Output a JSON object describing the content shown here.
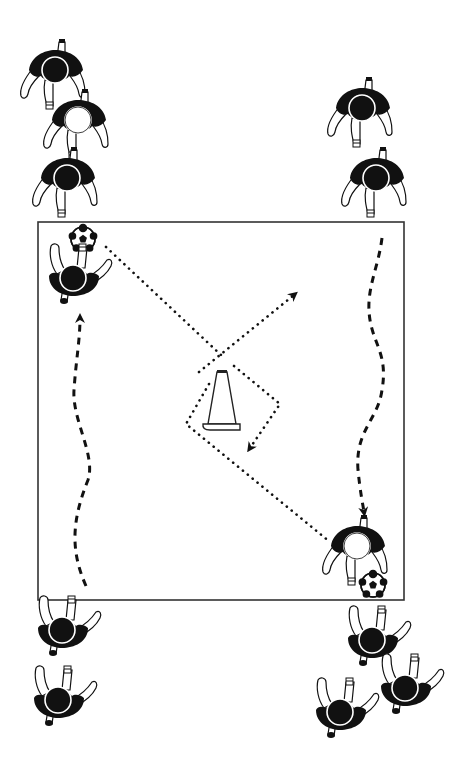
{
  "diagram": {
    "type": "soccer-drill",
    "description": "Dribble and pass around cone drill",
    "colors": {
      "background": "#ffffff",
      "ink": "#111111",
      "field_line": "#333333",
      "shirt": "#111111",
      "skin": "#ffffff"
    },
    "field": {
      "x": 38,
      "y": 222,
      "width": 366,
      "height": 378
    },
    "cone": {
      "x": 222,
      "y": 372,
      "label": "cone"
    },
    "balls": [
      {
        "id": "ball-left",
        "x": 83,
        "y": 239,
        "r": 12
      },
      {
        "id": "ball-right",
        "x": 373,
        "y": 585,
        "r": 12
      }
    ],
    "players": [
      {
        "id": "queue-top-left-1",
        "x": 55,
        "y": 72,
        "facing": "up",
        "head": "dark"
      },
      {
        "id": "queue-top-left-2",
        "x": 78,
        "y": 122,
        "facing": "up",
        "head": "light"
      },
      {
        "id": "queue-top-left-3",
        "x": 67,
        "y": 180,
        "facing": "up",
        "head": "dark"
      },
      {
        "id": "queue-top-right-1",
        "x": 362,
        "y": 110,
        "facing": "up",
        "head": "dark"
      },
      {
        "id": "queue-top-right-2",
        "x": 376,
        "y": 180,
        "facing": "up",
        "head": "dark"
      },
      {
        "id": "active-left",
        "x": 73,
        "y": 278,
        "facing": "down-arms",
        "head": "dark"
      },
      {
        "id": "active-right",
        "x": 357,
        "y": 548,
        "facing": "up",
        "head": "light"
      },
      {
        "id": "queue-bottom-left-1",
        "x": 62,
        "y": 630,
        "facing": "down-arms",
        "head": "dark"
      },
      {
        "id": "queue-bottom-left-2",
        "x": 58,
        "y": 700,
        "facing": "down-arms",
        "head": "dark"
      },
      {
        "id": "queue-bottom-right-1",
        "x": 372,
        "y": 640,
        "facing": "down-arms",
        "head": "dark"
      },
      {
        "id": "queue-bottom-right-2",
        "x": 405,
        "y": 688,
        "facing": "down-arms",
        "head": "dark"
      },
      {
        "id": "queue-bottom-right-3",
        "x": 340,
        "y": 712,
        "facing": "down-arms",
        "head": "dark"
      }
    ],
    "paths": {
      "dribble_left": {
        "style": "dashed",
        "d": "M 86 586 C 70 550, 72 520, 88 480 C 96 455, 72 420, 74 390 C 76 360, 80 340, 80 318",
        "arrow_at": [
          80,
          318
        ],
        "arrow_dir": "up"
      },
      "dribble_right": {
        "style": "dashed",
        "d": "M 382 238 C 378 270, 365 290, 370 320 C 374 345, 388 355, 382 390 C 378 420, 355 430, 358 470 C 360 490, 362 500, 364 512",
        "arrow_at": [
          364,
          512
        ],
        "arrow_dir": "down"
      },
      "pass_left_to_cone": {
        "style": "dotted",
        "points": [
          [
            106,
            247
          ],
          [
            221,
            355
          ]
        ]
      },
      "run_cone_to_topright": {
        "style": "dotted",
        "points": [
          [
            199,
            372
          ],
          [
            294,
            295
          ]
        ],
        "arrow_at": [
          294,
          295
        ]
      },
      "loop_cone_right": {
        "style": "dotted",
        "points": [
          [
            234,
            366
          ],
          [
            280,
            404
          ],
          [
            250,
            448
          ]
        ],
        "arrow_at": [
          250,
          448
        ]
      },
      "pass_cone_to_right": {
        "style": "dotted",
        "points": [
          [
            209,
            384
          ],
          [
            186,
            424
          ],
          [
            330,
            542
          ]
        ]
      }
    }
  }
}
